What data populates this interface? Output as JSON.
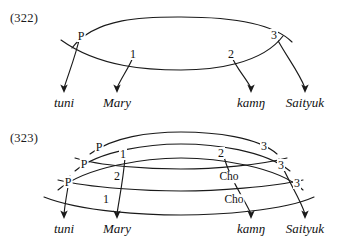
{
  "document": {
    "type": "linguistic-relational-network-diagrams",
    "background_color": "#ffffff",
    "stroke_color": "#1a1a1a"
  },
  "figures": [
    {
      "id": "fig322",
      "number": "(322)",
      "words": [
        {
          "text": "tuni",
          "x": 64,
          "y": 103
        },
        {
          "text": "Mary",
          "x": 117,
          "y": 103
        },
        {
          "text": "kamŋ",
          "x": 251,
          "y": 103
        },
        {
          "text": "Saityuk",
          "x": 305,
          "y": 103
        }
      ],
      "arc_labels": [
        {
          "text": "P",
          "x": 81,
          "y": 36
        },
        {
          "text": "1",
          "x": 133,
          "y": 54
        },
        {
          "text": "2",
          "x": 231,
          "y": 54
        },
        {
          "text": "3",
          "x": 274,
          "y": 35
        }
      ]
    },
    {
      "id": "fig323",
      "number": "(323)",
      "words": [
        {
          "text": "tuni",
          "x": 64,
          "y": 103
        },
        {
          "text": "Mary",
          "x": 117,
          "y": 103
        },
        {
          "text": "kamŋ",
          "x": 251,
          "y": 103
        },
        {
          "text": "Saityuk",
          "x": 305,
          "y": 103
        }
      ],
      "arc_labels": [
        {
          "text": "P",
          "x": 99,
          "y": 21
        },
        {
          "text": "1",
          "x": 123,
          "y": 28
        },
        {
          "text": "2",
          "x": 221,
          "y": 27
        },
        {
          "text": "3",
          "x": 264,
          "y": 20
        },
        {
          "text": "P",
          "x": 84,
          "y": 38
        },
        {
          "text": "2",
          "x": 117,
          "y": 50
        },
        {
          "text": "Cho",
          "x": 229,
          "y": 51
        },
        {
          "text": "3",
          "x": 281,
          "y": 39
        },
        {
          "text": "P",
          "x": 68,
          "y": 56
        },
        {
          "text": "1",
          "x": 106,
          "y": 73
        },
        {
          "text": "Cho",
          "x": 234,
          "y": 74
        },
        {
          "text": "3",
          "x": 297,
          "y": 57
        }
      ]
    }
  ],
  "legend": {
    "P": "Predicate",
    "1": "Subject",
    "2": "Direct Object",
    "3": "Indirect Object",
    "Cho": "Chômeur"
  }
}
